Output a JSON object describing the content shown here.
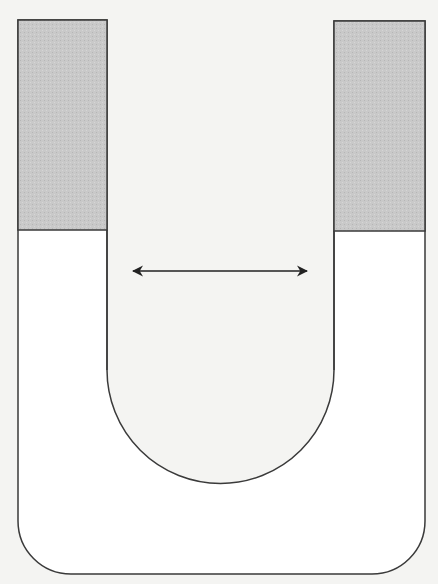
{
  "diagram": {
    "colors": {
      "background": "#f4f4f2",
      "outline": "#3a3a3a",
      "shaded_fluid": "#c8c8c8",
      "tube_interior": "#ffffff",
      "arrow": "#222222"
    },
    "tube": {
      "outer_left_x": 18,
      "outer_right_x": 425,
      "inner_left_x": 107,
      "inner_right_x": 334,
      "top_y": 20,
      "outer_bottom_y": 574,
      "outer_corner_radius": 53,
      "inner_arc_center_x": 220.5,
      "inner_arc_center_y": 370,
      "inner_arc_radius": 113.5
    },
    "left_column": {
      "label": "left-arm-fluid",
      "top_y": 20,
      "interface_y": 230
    },
    "right_column": {
      "label": "right-arm-fluid",
      "top_y": 21,
      "interface_y": 231
    },
    "arrow": {
      "label": "horizontal-separation",
      "x1": 132,
      "x2": 308,
      "y": 271,
      "double_headed": true
    }
  }
}
